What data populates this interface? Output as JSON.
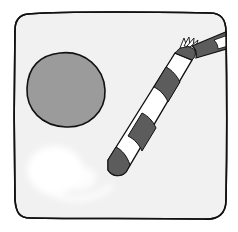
{
  "illustration": {
    "subject": "drink-top-view-with-straw",
    "colors": {
      "background": "#ffffff",
      "frame_fill": "#f1f1f1",
      "outline": "#111111",
      "circle_fill": "#9b9b9b",
      "straw_dark": "#5c5c5c",
      "straw_light": "#ffffff",
      "glare": "#ffffff"
    },
    "elements": [
      {
        "name": "frame",
        "shape": "rounded-square"
      },
      {
        "name": "round-object",
        "shape": "circle"
      },
      {
        "name": "straw",
        "shape": "bent-striped-straw"
      },
      {
        "name": "glare",
        "shape": "soft-white-highlight"
      }
    ]
  }
}
